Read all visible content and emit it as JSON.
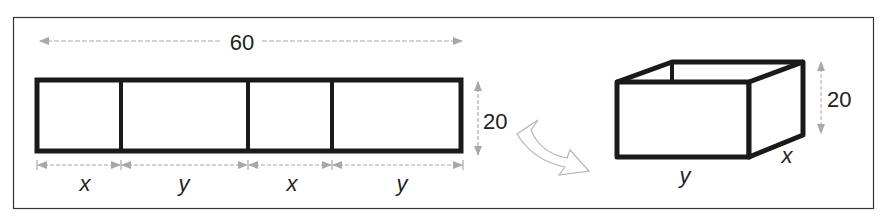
{
  "diagram": {
    "strip": {
      "total_length_label": "60",
      "height_label": "20",
      "segments": [
        {
          "label": "x"
        },
        {
          "label": "y"
        },
        {
          "label": "x"
        },
        {
          "label": "y"
        }
      ]
    },
    "fold_arrow": {
      "meaning": "folds into"
    },
    "box": {
      "length_label": "y",
      "width_label": "x",
      "height_label": "20"
    },
    "colors": {
      "outline": "#1a1a1a",
      "dimension_arrow": "#a8a8a8",
      "frame": "#333333"
    }
  }
}
